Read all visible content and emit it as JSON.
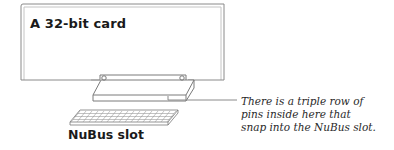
{
  "diagram": {
    "card": {
      "title": "A 32-bit card"
    },
    "slot": {
      "label": "NuBus slot"
    },
    "callout": {
      "lines": [
        "There is a triple row of",
        "pins inside here that",
        "snap into the NuBus slot."
      ]
    },
    "colors": {
      "outline": "#8a8a8a",
      "text": "#1a1a1a",
      "background": "#ffffff"
    }
  }
}
